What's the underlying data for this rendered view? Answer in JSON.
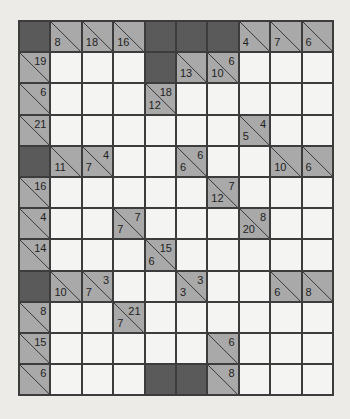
{
  "puzzle": {
    "type": "kakuro",
    "rows": 12,
    "cols": 10,
    "colors": {
      "background": "#ecebe8",
      "white_cell": "#f4f4f2",
      "clue_cell": "#a9a9a9",
      "block_cell": "#5a5a5a",
      "grid_line": "#3c3c3c"
    },
    "grid": [
      [
        {
          "t": "B"
        },
        {
          "t": "C",
          "d": "8"
        },
        {
          "t": "C",
          "d": "18"
        },
        {
          "t": "C",
          "d": "16"
        },
        {
          "t": "B"
        },
        {
          "t": "B"
        },
        {
          "t": "B"
        },
        {
          "t": "C",
          "d": "4"
        },
        {
          "t": "C",
          "d": "7"
        },
        {
          "t": "C",
          "d": "6"
        }
      ],
      [
        {
          "t": "C",
          "a": "19"
        },
        {
          "t": "W"
        },
        {
          "t": "W"
        },
        {
          "t": "W"
        },
        {
          "t": "B"
        },
        {
          "t": "C",
          "d": "13"
        },
        {
          "t": "C",
          "a": "6",
          "d": "10"
        },
        {
          "t": "W"
        },
        {
          "t": "W"
        },
        {
          "t": "W"
        }
      ],
      [
        {
          "t": "C",
          "a": "6"
        },
        {
          "t": "W"
        },
        {
          "t": "W"
        },
        {
          "t": "W"
        },
        {
          "t": "C",
          "a": "18",
          "d": "12"
        },
        {
          "t": "W"
        },
        {
          "t": "W"
        },
        {
          "t": "W"
        },
        {
          "t": "W"
        },
        {
          "t": "W"
        }
      ],
      [
        {
          "t": "C",
          "a": "21"
        },
        {
          "t": "W"
        },
        {
          "t": "W"
        },
        {
          "t": "W"
        },
        {
          "t": "W"
        },
        {
          "t": "W"
        },
        {
          "t": "W"
        },
        {
          "t": "C",
          "a": "4",
          "d": "5"
        },
        {
          "t": "W"
        },
        {
          "t": "W"
        }
      ],
      [
        {
          "t": "B"
        },
        {
          "t": "C",
          "d": "11"
        },
        {
          "t": "C",
          "a": "4",
          "d": "7"
        },
        {
          "t": "W"
        },
        {
          "t": "W"
        },
        {
          "t": "C",
          "a": "6",
          "d": "6"
        },
        {
          "t": "W"
        },
        {
          "t": "W"
        },
        {
          "t": "C",
          "d": "10"
        },
        {
          "t": "C",
          "d": "6"
        }
      ],
      [
        {
          "t": "C",
          "a": "16"
        },
        {
          "t": "W"
        },
        {
          "t": "W"
        },
        {
          "t": "W"
        },
        {
          "t": "W"
        },
        {
          "t": "W"
        },
        {
          "t": "C",
          "a": "7",
          "d": "12"
        },
        {
          "t": "W"
        },
        {
          "t": "W"
        },
        {
          "t": "W"
        }
      ],
      [
        {
          "t": "C",
          "a": "4"
        },
        {
          "t": "W"
        },
        {
          "t": "W"
        },
        {
          "t": "C",
          "a": "7",
          "d": "7"
        },
        {
          "t": "W"
        },
        {
          "t": "W"
        },
        {
          "t": "W"
        },
        {
          "t": "C",
          "a": "8",
          "d": "20"
        },
        {
          "t": "W"
        },
        {
          "t": "W"
        }
      ],
      [
        {
          "t": "C",
          "a": "14"
        },
        {
          "t": "W"
        },
        {
          "t": "W"
        },
        {
          "t": "W"
        },
        {
          "t": "C",
          "a": "15",
          "d": "6"
        },
        {
          "t": "W"
        },
        {
          "t": "W"
        },
        {
          "t": "W"
        },
        {
          "t": "W"
        },
        {
          "t": "W"
        }
      ],
      [
        {
          "t": "B"
        },
        {
          "t": "C",
          "d": "10"
        },
        {
          "t": "C",
          "a": "3",
          "d": "7"
        },
        {
          "t": "W"
        },
        {
          "t": "W"
        },
        {
          "t": "C",
          "a": "3",
          "d": "3"
        },
        {
          "t": "W"
        },
        {
          "t": "W"
        },
        {
          "t": "C",
          "d": "6"
        },
        {
          "t": "C",
          "d": "8"
        }
      ],
      [
        {
          "t": "C",
          "a": "8"
        },
        {
          "t": "W"
        },
        {
          "t": "W"
        },
        {
          "t": "C",
          "a": "21",
          "d": "7"
        },
        {
          "t": "W"
        },
        {
          "t": "W"
        },
        {
          "t": "W"
        },
        {
          "t": "W"
        },
        {
          "t": "W"
        },
        {
          "t": "W"
        }
      ],
      [
        {
          "t": "C",
          "a": "15"
        },
        {
          "t": "W"
        },
        {
          "t": "W"
        },
        {
          "t": "W"
        },
        {
          "t": "W"
        },
        {
          "t": "W"
        },
        {
          "t": "C",
          "a": "6"
        },
        {
          "t": "W"
        },
        {
          "t": "W"
        },
        {
          "t": "W"
        }
      ],
      [
        {
          "t": "C",
          "a": "6"
        },
        {
          "t": "W"
        },
        {
          "t": "W"
        },
        {
          "t": "W"
        },
        {
          "t": "B"
        },
        {
          "t": "B"
        },
        {
          "t": "C",
          "a": "8"
        },
        {
          "t": "W"
        },
        {
          "t": "W"
        },
        {
          "t": "W"
        }
      ]
    ]
  }
}
